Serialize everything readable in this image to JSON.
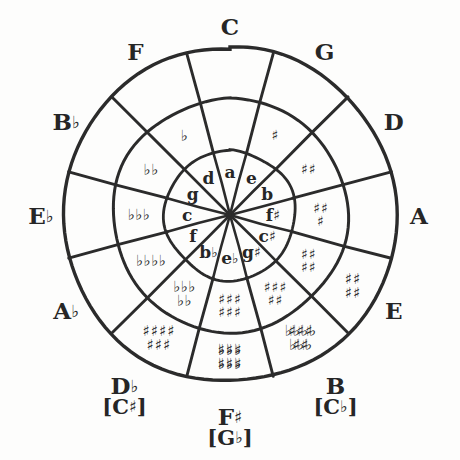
{
  "diagram": {
    "name": "circle-of-fifths",
    "center": {
      "x": 230,
      "y": 215
    },
    "radii": {
      "outer": 167,
      "middle": 117,
      "inner": 65
    },
    "ink_color": "#2b2b2b",
    "background_color": "#ffffff",
    "glyphs": {
      "sharp": "♯",
      "flat": "♭",
      "natural": "♮"
    }
  },
  "majors": [
    {
      "id": "c",
      "label": "C",
      "accidental": "",
      "enharmonic": "",
      "enharmonic_accidental": "",
      "angle_deg": 0,
      "accidental_count": 0,
      "accidental_type": "none"
    },
    {
      "id": "g",
      "label": "G",
      "accidental": "",
      "enharmonic": "",
      "enharmonic_accidental": "",
      "angle_deg": 30,
      "accidental_count": 1,
      "accidental_type": "sharp"
    },
    {
      "id": "d",
      "label": "D",
      "accidental": "",
      "enharmonic": "",
      "enharmonic_accidental": "",
      "angle_deg": 60,
      "accidental_count": 2,
      "accidental_type": "sharp"
    },
    {
      "id": "a",
      "label": "A",
      "accidental": "",
      "enharmonic": "",
      "enharmonic_accidental": "",
      "angle_deg": 90,
      "accidental_count": 3,
      "accidental_type": "sharp"
    },
    {
      "id": "e",
      "label": "E",
      "accidental": "",
      "enharmonic": "",
      "enharmonic_accidental": "",
      "angle_deg": 120,
      "accidental_count": 4,
      "accidental_type": "sharp"
    },
    {
      "id": "b",
      "label": "B",
      "accidental": "",
      "enharmonic": "C",
      "enharmonic_accidental": "♭",
      "angle_deg": 150,
      "accidental_count": 5,
      "accidental_type": "sharp"
    },
    {
      "id": "fs",
      "label": "F",
      "accidental": "♯",
      "enharmonic": "G",
      "enharmonic_accidental": "♭",
      "angle_deg": 180,
      "accidental_count": 6,
      "accidental_type": "sharp"
    },
    {
      "id": "db",
      "label": "D",
      "accidental": "♭",
      "enharmonic": "C",
      "enharmonic_accidental": "♯",
      "angle_deg": 210,
      "accidental_count": 5,
      "accidental_type": "flat"
    },
    {
      "id": "ab",
      "label": "A",
      "accidental": "♭",
      "enharmonic": "",
      "enharmonic_accidental": "",
      "angle_deg": 240,
      "accidental_count": 4,
      "accidental_type": "flat"
    },
    {
      "id": "eb",
      "label": "E",
      "accidental": "♭",
      "enharmonic": "",
      "enharmonic_accidental": "",
      "angle_deg": 270,
      "accidental_count": 3,
      "accidental_type": "flat"
    },
    {
      "id": "bb",
      "label": "B",
      "accidental": "♭",
      "enharmonic": "",
      "enharmonic_accidental": "",
      "angle_deg": 300,
      "accidental_count": 2,
      "accidental_type": "flat"
    },
    {
      "id": "f",
      "label": "F",
      "accidental": "",
      "enharmonic": "",
      "enharmonic_accidental": "",
      "angle_deg": 330,
      "accidental_count": 1,
      "accidental_type": "flat"
    }
  ],
  "minors": [
    {
      "id": "a-min",
      "label": "a",
      "accidental": "",
      "angle_deg": 0
    },
    {
      "id": "e-min",
      "label": "e",
      "accidental": "",
      "angle_deg": 30
    },
    {
      "id": "b-min",
      "label": "b",
      "accidental": "",
      "angle_deg": 60
    },
    {
      "id": "fs-min",
      "label": "f",
      "accidental": "♯",
      "angle_deg": 90
    },
    {
      "id": "cs-min",
      "label": "c",
      "accidental": "♯",
      "angle_deg": 120
    },
    {
      "id": "gs-min",
      "label": "g",
      "accidental": "♯",
      "angle_deg": 150
    },
    {
      "id": "eb-min",
      "label": "e",
      "accidental": "♭",
      "angle_deg": 180
    },
    {
      "id": "bb-min",
      "label": "b",
      "accidental": "♭",
      "angle_deg": 210
    },
    {
      "id": "f-min",
      "label": "f",
      "accidental": "",
      "angle_deg": 240
    },
    {
      "id": "c-min",
      "label": "c",
      "accidental": "",
      "angle_deg": 270
    },
    {
      "id": "g-min",
      "label": "g",
      "accidental": "",
      "angle_deg": 300
    },
    {
      "id": "d-min",
      "label": "d",
      "accidental": "",
      "angle_deg": 330
    }
  ],
  "key_signatures": [
    {
      "id": "ks-c",
      "for": "C",
      "text_rows": [],
      "type": "none",
      "count": 0,
      "ring": "middle",
      "angle_deg": 0
    },
    {
      "id": "ks-g",
      "for": "G",
      "text_rows": [
        "♯"
      ],
      "type": "sharp",
      "count": 1,
      "ring": "middle",
      "angle_deg": 30
    },
    {
      "id": "ks-d",
      "for": "D",
      "text_rows": [
        "♯♯"
      ],
      "type": "sharp",
      "count": 2,
      "ring": "middle",
      "angle_deg": 60
    },
    {
      "id": "ks-a",
      "for": "A",
      "text_rows": [
        "♯♯",
        "♯"
      ],
      "type": "sharp",
      "count": 3,
      "ring": "middle",
      "angle_deg": 90
    },
    {
      "id": "ks-e",
      "for": "E",
      "text_rows": [
        "♯♯",
        "♯♯"
      ],
      "type": "sharp",
      "count": 4,
      "ring": "middle",
      "angle_deg": 120
    },
    {
      "id": "ks-b",
      "for": "B",
      "text_rows": [
        "♯♯♯",
        "♯♯"
      ],
      "type": "sharp",
      "count": 5,
      "ring": "middle",
      "angle_deg": 150
    },
    {
      "id": "ks-fs",
      "for": "F♯",
      "text_rows": [
        "♯♯♯",
        "♯♯♯"
      ],
      "type": "sharp",
      "count": 6,
      "ring": "middle",
      "angle_deg": 180
    },
    {
      "id": "ks-db",
      "for": "D♭",
      "text_rows": [
        "♭♭♭",
        "♭♭"
      ],
      "type": "flat",
      "count": 5,
      "ring": "middle",
      "angle_deg": 210
    },
    {
      "id": "ks-ab",
      "for": "A♭",
      "text_rows": [
        "♭♭♭♭"
      ],
      "type": "flat",
      "count": 4,
      "ring": "middle",
      "angle_deg": 240
    },
    {
      "id": "ks-eb",
      "for": "E♭",
      "text_rows": [
        "♭♭♭"
      ],
      "type": "flat",
      "count": 3,
      "ring": "middle",
      "angle_deg": 270
    },
    {
      "id": "ks-bb",
      "for": "B♭",
      "text_rows": [
        "♭♭"
      ],
      "type": "flat",
      "count": 2,
      "ring": "middle",
      "angle_deg": 300
    },
    {
      "id": "ks-f",
      "for": "F",
      "text_rows": [
        "♭"
      ],
      "type": "flat",
      "count": 1,
      "ring": "middle",
      "angle_deg": 330
    },
    {
      "id": "ks-gb",
      "for": "G♭",
      "text_rows": [
        "♭♭♭",
        "♭♭♭"
      ],
      "type": "flat",
      "count": 6,
      "ring": "outer",
      "angle_deg": 180
    },
    {
      "id": "ks-cb",
      "for": "C♭",
      "text_rows": [
        "♭♭♭♭",
        "♭♭♭"
      ],
      "type": "flat",
      "count": 7,
      "ring": "outer",
      "angle_deg": 150
    },
    {
      "id": "ks-cs",
      "for": "C♯",
      "text_rows": [
        "♯♯♯♯",
        "♯♯♯"
      ],
      "type": "sharp",
      "count": 7,
      "ring": "outer",
      "angle_deg": 210
    },
    {
      "id": "ks-b-outer",
      "for": "B",
      "text_rows": [
        "♯♯♯",
        "♯♯"
      ],
      "type": "sharp",
      "count": 5,
      "ring": "outer",
      "angle_deg": 150
    },
    {
      "id": "ks-fs-outer",
      "for": "F♯",
      "text_rows": [
        "♯♯♯",
        "♯♯♯"
      ],
      "type": "sharp",
      "count": 6,
      "ring": "outer",
      "angle_deg": 180
    },
    {
      "id": "ks-e-outer",
      "for": "E",
      "text_rows": [
        "♯♯",
        "♯♯"
      ],
      "type": "sharp",
      "count": 4,
      "ring": "outer",
      "angle_deg": 120
    }
  ]
}
